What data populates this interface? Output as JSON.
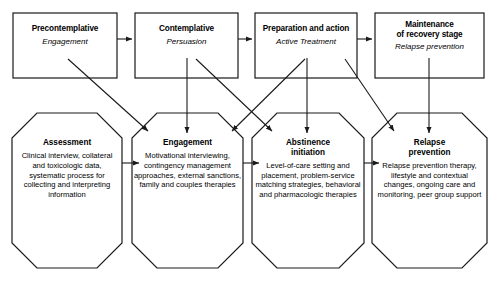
{
  "diagram": {
    "stroke_color": "#1a1a1a",
    "background_color": "#ffffff",
    "stages": [
      {
        "name": "Precontemplative",
        "task": "Engagement"
      },
      {
        "name": "Contemplative",
        "task": "Persuasion"
      },
      {
        "name": "Preparation and action",
        "task": "Active Treatment"
      },
      {
        "name": "Maintenance\nof recovery stage",
        "task": "Relapse prevention"
      }
    ],
    "interventions": [
      {
        "name": "Assessment",
        "detail": "Clinical interview, collateral and toxicologic data, systematic process for collecting and interpreting information"
      },
      {
        "name": "Engagement",
        "detail": "Motivational interviewing, contingency management approaches, external sanctions, family and couples therapies"
      },
      {
        "name": "Abstinence\ninitiation",
        "detail": "Level-of-care setting and placement, problem-service matching strategies, behavioral and pharmacologic therapies"
      },
      {
        "name": "Relapse\nprevention",
        "detail": "Relapse prevention therapy, lifestyle and contextual changes, ongoing care and monitoring, peer group support"
      }
    ]
  }
}
